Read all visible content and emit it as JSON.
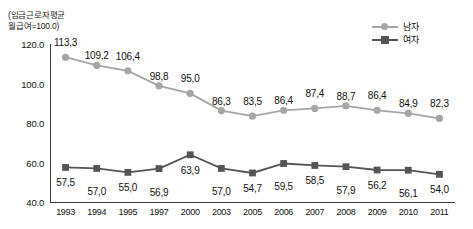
{
  "chart_data": {
    "type": "line",
    "title": "",
    "caption": "(임금근로자평균\n월급여=100.0)",
    "xlabel": "",
    "ylabel": "",
    "grid": false,
    "legend_position": "top-right",
    "ylim": [
      40.0,
      120.0
    ],
    "yticks": [
      "40.0",
      "60.0",
      "80.0",
      "100.0",
      "120.0"
    ],
    "ytick_values": [
      40.0,
      60.0,
      80.0,
      100.0,
      120.0
    ],
    "categories": [
      "1993",
      "1994",
      "1995",
      "1997",
      "2000",
      "2003",
      "2005",
      "2006",
      "2007",
      "2008",
      "2009",
      "2010",
      "2011"
    ],
    "series": [
      {
        "name": "남자",
        "marker": "circle",
        "color": "#a6a6a6",
        "label_position": "above",
        "values": [
          113.3,
          109.2,
          106.4,
          98.8,
          95.0,
          86.3,
          83.5,
          86.4,
          87.4,
          88.7,
          86.4,
          84.9,
          82.3
        ],
        "labels": [
          "113,3",
          "109,2",
          "106,4",
          "98,8",
          "95,0",
          "86,3",
          "83,5",
          "86,4",
          "87,4",
          "88,7",
          "86,4",
          "84,9",
          "82,3"
        ]
      },
      {
        "name": "여자",
        "marker": "square",
        "color": "#555555",
        "label_position": "below",
        "values": [
          57.5,
          57.0,
          55.0,
          56.9,
          63.9,
          57.0,
          54.7,
          59.5,
          58.5,
          57.9,
          56.2,
          56.1,
          54.0
        ],
        "labels": [
          "57,5",
          "57,0",
          "55,0",
          "56,9",
          "63,9",
          "57,0",
          "54,7",
          "59,5",
          "58,5",
          "57,9",
          "56,2",
          "56,1",
          "54,0"
        ]
      }
    ]
  }
}
